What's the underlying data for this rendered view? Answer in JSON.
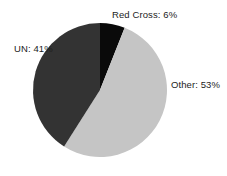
{
  "chart_data": {
    "type": "pie",
    "title": "",
    "subtitle": "",
    "xlabel": "",
    "ylabel": "",
    "grid": false,
    "legend_position": "none",
    "label_style": "outside-labels",
    "labels": [
      "Red Cross",
      "Other",
      "UN"
    ],
    "values": [
      6,
      53,
      41
    ],
    "units": "percent",
    "total": 100,
    "start_angle_deg": 0,
    "direction": "clockwise",
    "slices": [
      {
        "name": "Red Cross",
        "value": 6,
        "label": "Red Cross: 6%",
        "color": "#0a0a0a",
        "start_angle_deg": 0,
        "end_angle_deg": 21.6
      },
      {
        "name": "Other",
        "value": 53,
        "label": "Other: 53%",
        "color": "#c5c5c5",
        "start_angle_deg": 21.6,
        "end_angle_deg": 212.4
      },
      {
        "name": "UN",
        "value": 41,
        "label": "UN: 41%",
        "color": "#333333",
        "start_angle_deg": 212.4,
        "end_angle_deg": 360
      }
    ],
    "geometry": {
      "center_x": 100,
      "center_y": 90,
      "radius": 67
    }
  },
  "canvas": {
    "background": "#ffffff",
    "width": 227,
    "height": 176
  },
  "labels": {
    "red_cross": "Red Cross: 6%",
    "other": "Other: 53%",
    "un": "UN: 41%"
  },
  "colors": {
    "red_cross": "#0a0a0a",
    "other": "#c5c5c5",
    "un": "#333333",
    "label_text": "#1c1c1c",
    "background": "#ffffff"
  }
}
